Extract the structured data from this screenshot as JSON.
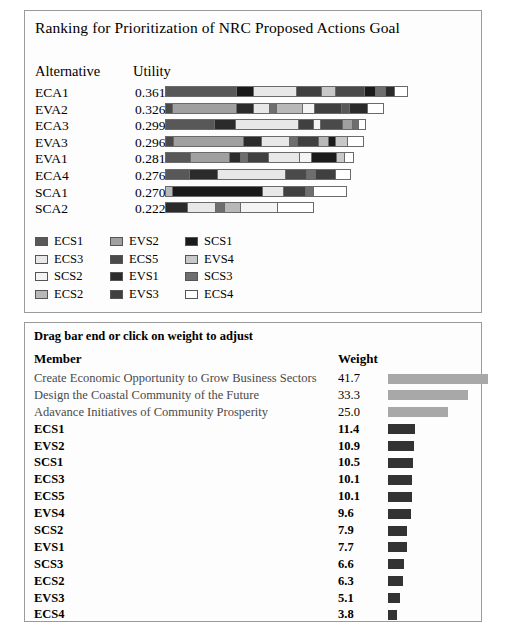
{
  "window": {
    "panels": [
      "ranking-panel",
      "weights-panel"
    ]
  },
  "ranking": {
    "title": "Ranking for Prioritization of NRC Proposed Actions Goal",
    "columns": {
      "alternative": "Alternative",
      "utility": "Utility"
    },
    "bar_scale_max": 0.361,
    "bar_max_px": 243,
    "alternatives": [
      {
        "name": "ECA1",
        "utility": "0.361",
        "utility_value": 0.361,
        "segments": [
          {
            "member": "ECS1",
            "frac": 0.3
          },
          {
            "member": "SCS1",
            "frac": 0.07
          },
          {
            "member": "ECS3",
            "frac": 0.18
          },
          {
            "member": "EVS3",
            "frac": 0.105
          },
          {
            "member": "EVS4",
            "frac": 0.055
          },
          {
            "member": "ECS5",
            "frac": 0.12
          },
          {
            "member": "SCS1",
            "frac": 0.045
          },
          {
            "member": "SCS3",
            "frac": 0.04
          },
          {
            "member": "EVS1",
            "frac": 0.035
          },
          {
            "member": "ECS4",
            "frac": 0.05
          }
        ]
      },
      {
        "name": "EVA2",
        "utility": "0.326",
        "utility_value": 0.326,
        "segments": [
          {
            "member": "ECS5",
            "frac": 0.03
          },
          {
            "member": "EVS2",
            "frac": 0.33
          },
          {
            "member": "EVS1",
            "frac": 0.085
          },
          {
            "member": "ECS3",
            "frac": 0.075
          },
          {
            "member": "SCS3",
            "frac": 0.03
          },
          {
            "member": "ECS2",
            "frac": 0.13
          },
          {
            "member": "SCS2",
            "frac": 0.06
          },
          {
            "member": "EVS3",
            "frac": 0.135
          },
          {
            "member": "ECS1",
            "frac": 0.035
          },
          {
            "member": "EVS1",
            "frac": 0.09
          },
          {
            "member": "ECS4",
            "frac": 0.08
          }
        ]
      },
      {
        "name": "ECA3",
        "utility": "0.299",
        "utility_value": 0.299,
        "segments": [
          {
            "member": "ECS1",
            "frac": 0.25
          },
          {
            "member": "EVS1",
            "frac": 0.105
          },
          {
            "member": "ECS3",
            "frac": 0.325
          },
          {
            "member": "EVS3",
            "frac": 0.075
          },
          {
            "member": "SCS2",
            "frac": 0.03
          },
          {
            "member": "ECS5",
            "frac": 0.11
          },
          {
            "member": "EVS2",
            "frac": 0.045
          },
          {
            "member": "SCS3",
            "frac": 0.025
          },
          {
            "member": "ECS4",
            "frac": 0.035
          }
        ]
      },
      {
        "name": "EVA3",
        "utility": "0.296",
        "utility_value": 0.296,
        "segments": [
          {
            "member": "ECS5",
            "frac": 0.035
          },
          {
            "member": "EVS2",
            "frac": 0.37
          },
          {
            "member": "EVS1",
            "frac": 0.09
          },
          {
            "member": "ECS3",
            "frac": 0.145
          },
          {
            "member": "SCS3",
            "frac": 0.035
          },
          {
            "member": "EVS3",
            "frac": 0.105
          },
          {
            "member": "ECS2",
            "frac": 0.05
          },
          {
            "member": "SCS1",
            "frac": 0.03
          },
          {
            "member": "EVS4",
            "frac": 0.06
          },
          {
            "member": "ECS4",
            "frac": 0.08
          }
        ]
      },
      {
        "name": "EVA1",
        "utility": "0.281",
        "utility_value": 0.281,
        "segments": [
          {
            "member": "ECS1",
            "frac": 0.135
          },
          {
            "member": "EVS2",
            "frac": 0.215
          },
          {
            "member": "EVS1",
            "frac": 0.055
          },
          {
            "member": "SCS3",
            "frac": 0.035
          },
          {
            "member": "EVS3",
            "frac": 0.11
          },
          {
            "member": "ECS3",
            "frac": 0.17
          },
          {
            "member": "SCS2",
            "frac": 0.06
          },
          {
            "member": "SCS1",
            "frac": 0.135
          },
          {
            "member": "EVS4",
            "frac": 0.04
          },
          {
            "member": "ECS4",
            "frac": 0.045
          }
        ]
      },
      {
        "name": "ECA4",
        "utility": "0.276",
        "utility_value": 0.276,
        "segments": [
          {
            "member": "ECS1",
            "frac": 0.13
          },
          {
            "member": "EVS1",
            "frac": 0.15
          },
          {
            "member": "ECS3",
            "frac": 0.38
          },
          {
            "member": "ECS5",
            "frac": 0.11
          },
          {
            "member": "SCS3",
            "frac": 0.045
          },
          {
            "member": "EVS3",
            "frac": 0.11
          },
          {
            "member": "ECS4",
            "frac": 0.075
          }
        ]
      },
      {
        "name": "SCA1",
        "utility": "0.270",
        "utility_value": 0.27,
        "segments": [
          {
            "member": "ECS2",
            "frac": 0.035
          },
          {
            "member": "SCS1",
            "frac": 0.51
          },
          {
            "member": "ECS3",
            "frac": 0.115
          },
          {
            "member": "EVS3",
            "frac": 0.12
          },
          {
            "member": "SCS3",
            "frac": 0.04
          },
          {
            "member": "ECS4",
            "frac": 0.18
          }
        ]
      },
      {
        "name": "SCA2",
        "utility": "0.222",
        "utility_value": 0.222,
        "segments": [
          {
            "member": "EVS1",
            "frac": 0.145
          },
          {
            "member": "ECS3",
            "frac": 0.19
          },
          {
            "member": "SCS3",
            "frac": 0.055
          },
          {
            "member": "ECS2",
            "frac": 0.11
          },
          {
            "member": "SCS2",
            "frac": 0.25
          },
          {
            "member": "ECS4",
            "frac": 0.25
          }
        ]
      }
    ],
    "legend": [
      {
        "label": "ECS1",
        "color": "#585858"
      },
      {
        "label": "EVS2",
        "color": "#a0a0a0"
      },
      {
        "label": "SCS1",
        "color": "#1a1a1a"
      },
      {
        "label": "ECS3",
        "color": "#e8e8e8"
      },
      {
        "label": "ECS5",
        "color": "#4a4a4a"
      },
      {
        "label": "EVS4",
        "color": "#c8c8c8"
      },
      {
        "label": "SCS2",
        "color": "#f4f4f4"
      },
      {
        "label": "EVS1",
        "color": "#2b2b2b"
      },
      {
        "label": "SCS3",
        "color": "#6e6e6e"
      },
      {
        "label": "ECS2",
        "color": "#b8b8b8"
      },
      {
        "label": "EVS3",
        "color": "#404040"
      },
      {
        "label": "ECS4",
        "color": "#ffffff"
      }
    ]
  },
  "weights": {
    "hint": "Drag bar end or click on weight to adjust",
    "columns": {
      "member": "Member",
      "weight": "Weight"
    },
    "bar_scale_max": 41.7,
    "bar_max_px": 100,
    "goal_bar_color": "#a8a8a8",
    "member_bar_color": "#333333",
    "rows": [
      {
        "member": "Create Economic Opportunity to Grow Business Sectors",
        "weight": "41.7",
        "value": 41.7,
        "kind": "goal"
      },
      {
        "member": "Design the Coastal Community of the Future",
        "weight": "33.3",
        "value": 33.3,
        "kind": "goal"
      },
      {
        "member": "Adavance Initiatives of Community Prosperity",
        "weight": "25.0",
        "value": 25.0,
        "kind": "goal"
      },
      {
        "member": "ECS1",
        "weight": "11.4",
        "value": 11.4,
        "kind": "member"
      },
      {
        "member": "EVS2",
        "weight": "10.9",
        "value": 10.9,
        "kind": "member"
      },
      {
        "member": "SCS1",
        "weight": "10.5",
        "value": 10.5,
        "kind": "member"
      },
      {
        "member": "ECS3",
        "weight": "10.1",
        "value": 10.1,
        "kind": "member"
      },
      {
        "member": "ECS5",
        "weight": "10.1",
        "value": 10.1,
        "kind": "member"
      },
      {
        "member": "EVS4",
        "weight": "9.6",
        "value": 9.6,
        "kind": "member"
      },
      {
        "member": "SCS2",
        "weight": "7.9",
        "value": 7.9,
        "kind": "member"
      },
      {
        "member": "EVS1",
        "weight": "7.7",
        "value": 7.7,
        "kind": "member"
      },
      {
        "member": "SCS3",
        "weight": "6.6",
        "value": 6.6,
        "kind": "member"
      },
      {
        "member": "ECS2",
        "weight": "6.3",
        "value": 6.3,
        "kind": "member"
      },
      {
        "member": "EVS3",
        "weight": "5.1",
        "value": 5.1,
        "kind": "member"
      },
      {
        "member": "ECS4",
        "weight": "3.8",
        "value": 3.8,
        "kind": "member"
      }
    ]
  }
}
